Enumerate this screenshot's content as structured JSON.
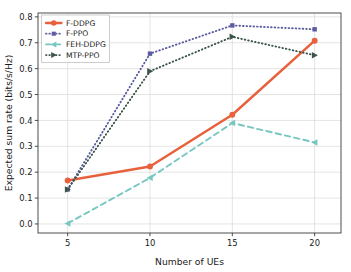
{
  "chart_data": {
    "type": "line",
    "title": "",
    "xlabel": "Number of UEs",
    "ylabel": "Expected sum rate (bits/s/Hz)",
    "x": [
      5,
      10,
      15,
      20
    ],
    "xticklabels": [
      "5",
      "10",
      "15",
      "20"
    ],
    "yticklabels": [
      "0.0",
      "0.1",
      "0.2",
      "0.3",
      "0.4",
      "0.5",
      "0.6",
      "0.7",
      "0.8"
    ],
    "yticks": [
      0.0,
      0.1,
      0.2,
      0.3,
      0.4,
      0.5,
      0.6,
      0.7,
      0.8
    ],
    "xlim": [
      3.2,
      21.6
    ],
    "ylim": [
      -0.035,
      0.815
    ],
    "grid": true,
    "legend_position": "upper left",
    "series": [
      {
        "name": "F-DDPG",
        "values": [
          0.168,
          0.222,
          0.422,
          0.708
        ],
        "color": "#E8613C",
        "linestyle": "solid",
        "marker": "circle"
      },
      {
        "name": "F-PPO",
        "values": [
          0.133,
          0.658,
          0.767,
          0.752
        ],
        "color": "#5B5BA0",
        "linestyle": "dotted",
        "marker": "square"
      },
      {
        "name": "FEH-DDPG",
        "values": [
          0.002,
          0.178,
          0.39,
          0.315
        ],
        "color": "#76C7C0",
        "linestyle": "dashed",
        "marker": "triangle-left"
      },
      {
        "name": "MTP-PPO",
        "values": [
          0.133,
          0.59,
          0.723,
          0.652
        ],
        "color": "#3C5448",
        "linestyle": "dotted",
        "marker": "triangle-right"
      }
    ]
  },
  "axes": {
    "frame_color": "#3a3a3a",
    "grid_color": "#d8d8d8",
    "background": "#ffffff"
  }
}
